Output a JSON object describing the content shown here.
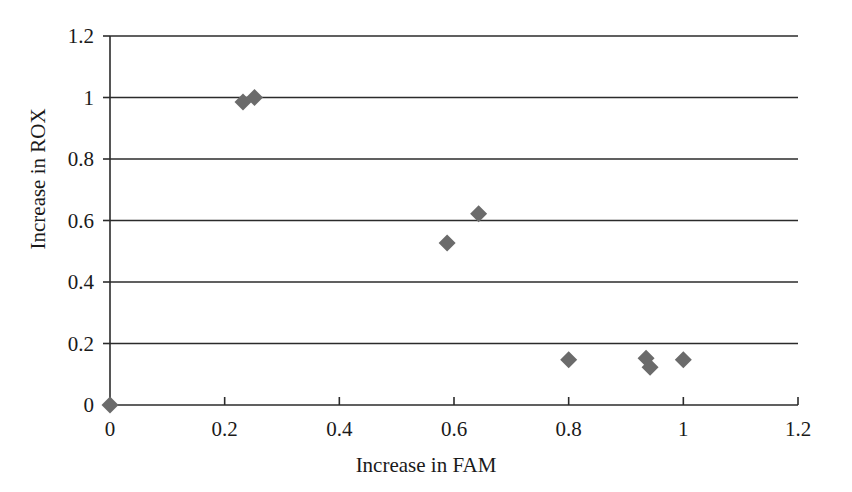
{
  "chart_data": {
    "type": "scatter",
    "title": "",
    "xlabel": "Increase in FAM",
    "ylabel": "Increase in ROX",
    "xlim": [
      0,
      1.2
    ],
    "ylim": [
      0,
      1.2
    ],
    "xticks": [
      "0",
      "0.2",
      "0.4",
      "0.6",
      "0.8",
      "1",
      "1.2"
    ],
    "xtick_values": [
      0,
      0.2,
      0.4,
      0.6,
      0.8,
      1.0,
      1.2
    ],
    "yticks": [
      "0",
      "0.2",
      "0.4",
      "0.6",
      "0.8",
      "1",
      "1.2"
    ],
    "ytick_values": [
      0,
      0.2,
      0.4,
      0.6,
      0.8,
      1.0,
      1.2
    ],
    "grid": "horizontal",
    "legend": "none",
    "marker": "diamond",
    "marker_color": "#6b6b6b",
    "axis_color": "#2b2b2b",
    "series": [
      {
        "name": "Increase in ROX vs Increase in FAM",
        "points": [
          {
            "x": 0.0,
            "y": 0.0
          },
          {
            "x": 0.232,
            "y": 0.985
          },
          {
            "x": 0.252,
            "y": 1.0
          },
          {
            "x": 0.588,
            "y": 0.527
          },
          {
            "x": 0.643,
            "y": 0.622
          },
          {
            "x": 0.8,
            "y": 0.147
          },
          {
            "x": 0.935,
            "y": 0.152
          },
          {
            "x": 0.942,
            "y": 0.123
          },
          {
            "x": 1.0,
            "y": 0.147
          }
        ]
      }
    ]
  },
  "geometry": {
    "plot_left": 110,
    "plot_right": 798,
    "plot_top": 36,
    "plot_bottom": 405
  }
}
